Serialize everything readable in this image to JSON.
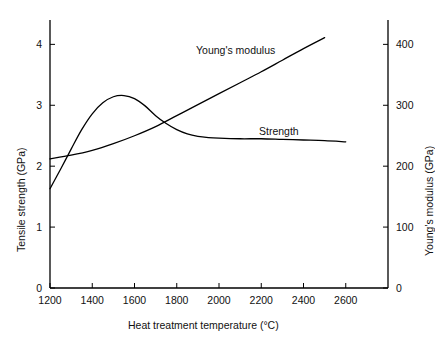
{
  "chart_data": {
    "type": "line",
    "title": "",
    "xlabel": "Heat treatment temperature",
    "xunit": "(°C)",
    "xlabel_full": "Heat treatment temperature   (°C)",
    "ylabel_left": "Tensile strength  (GPa)",
    "ylabel_right": "Young's modulus (GPa)",
    "xlim": [
      1200,
      2800
    ],
    "xticks": [
      1200,
      1400,
      1600,
      1800,
      2000,
      2200,
      2400,
      2600
    ],
    "xticklabels": [
      "1200",
      "1400",
      "1600",
      "1800",
      "2000",
      "2200",
      "2400",
      "2600"
    ],
    "ylim_left": [
      0,
      4.4
    ],
    "yticks_left": [
      0,
      1,
      2,
      3,
      4
    ],
    "yticklabels_left": [
      "0",
      "1",
      "2",
      "3",
      "4"
    ],
    "ylim_right": [
      0,
      440
    ],
    "yticks_right": [
      0,
      100,
      200,
      300,
      400
    ],
    "yticklabels_right": [
      "0",
      "100",
      "200",
      "300",
      "400"
    ],
    "grid": false,
    "legend": "inline-annotations",
    "annotations": [
      {
        "text": "Young's modulus",
        "x": 2130,
        "y_right": 370
      },
      {
        "text": "Strength",
        "x": 2400,
        "y_left": 2.72
      }
    ],
    "series": [
      {
        "name": "Strength",
        "axis": "left",
        "unit": "GPa",
        "color": "#000000",
        "x": [
          1200,
          1250,
          1300,
          1350,
          1400,
          1450,
          1500,
          1550,
          1600,
          1650,
          1700,
          1750,
          1800,
          1850,
          1900,
          1950,
          2000,
          2100,
          2200,
          2300,
          2400,
          2500,
          2600
        ],
        "values": [
          1.63,
          1.95,
          2.28,
          2.6,
          2.86,
          3.04,
          3.14,
          3.16,
          3.11,
          2.99,
          2.83,
          2.7,
          2.6,
          2.53,
          2.49,
          2.47,
          2.46,
          2.45,
          2.45,
          2.44,
          2.43,
          2.42,
          2.4
        ]
      },
      {
        "name": "Young's modulus",
        "axis": "right",
        "unit": "GPa",
        "color": "#000000",
        "x": [
          1200,
          1300,
          1400,
          1500,
          1600,
          1700,
          1800,
          1900,
          2000,
          2100,
          2200,
          2300,
          2400,
          2500
        ],
        "values": [
          212,
          218,
          226,
          237,
          250,
          265,
          283,
          301,
          319,
          337,
          355,
          374,
          393,
          411
        ]
      }
    ]
  }
}
